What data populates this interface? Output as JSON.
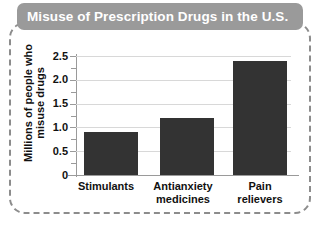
{
  "figure": {
    "title": "Misuse of Prescription Drugs in the U.S.",
    "title_bar_color": "#9a9a9a",
    "title_text_color": "#ffffff",
    "frame_style": "dashed-rounded",
    "frame_color": "#8c8c8c"
  },
  "chart_data": {
    "type": "bar",
    "title": "Misuse of Prescription Drugs in the U.S.",
    "categories": [
      "Stimulants",
      "Antianxiety medicines",
      "Pain relievers"
    ],
    "category_lines": [
      [
        "Stimulants"
      ],
      [
        "Antianxiety",
        "medicines"
      ],
      [
        "Pain",
        "relievers"
      ]
    ],
    "values": [
      0.9,
      1.2,
      2.4
    ],
    "xlabel": "",
    "ylabel": "Millions of people who misuse drugs",
    "ylabel_lines": [
      "Millions of people who",
      "misuse drugs"
    ],
    "ylim": [
      0,
      2.5
    ],
    "yticks": [
      0,
      0.5,
      1.0,
      1.5,
      2.0,
      2.5
    ],
    "ytick_labels": [
      "0",
      "0.5",
      "1.0",
      "1.5",
      "2.0",
      "2.5"
    ],
    "minor_ticks": [
      0.25,
      0.75,
      1.25,
      1.75,
      2.25
    ],
    "grid": "horizontal",
    "grid_color": "#d8d8d8",
    "legend": null,
    "bar_color": "#333333",
    "axis_color": "#9a9a9a"
  }
}
